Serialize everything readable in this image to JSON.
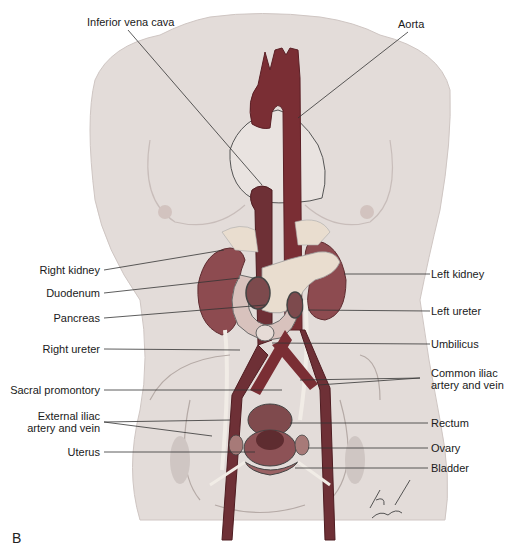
{
  "figure": {
    "panel_letter": "B",
    "signature": "Pat Thomas",
    "colors": {
      "skin": "#e3dcd9",
      "skin_shadow": "#cfc6c3",
      "vessel": "#7a2e34",
      "vessel_dark": "#5a1f25",
      "kidney": "#8d4b50",
      "pancreas": "#e9ddcf",
      "duodenum": "#d8c2bd",
      "ureter": "#f1ece6",
      "leader_line": "#333333"
    }
  },
  "labels": {
    "top": [
      {
        "id": "inferior-vena-cava",
        "text": "Inferior vena cava"
      },
      {
        "id": "aorta",
        "text": "Aorta"
      }
    ],
    "left": [
      {
        "id": "right-kidney",
        "text": "Right kidney"
      },
      {
        "id": "duodenum",
        "text": "Duodenum"
      },
      {
        "id": "pancreas",
        "text": "Pancreas"
      },
      {
        "id": "right-ureter",
        "text": "Right ureter"
      },
      {
        "id": "sacral-promontory",
        "text": "Sacral promontory"
      },
      {
        "id": "external-iliac",
        "line1": "External iliac",
        "line2": "artery and vein"
      },
      {
        "id": "uterus",
        "text": "Uterus"
      }
    ],
    "right": [
      {
        "id": "left-kidney",
        "text": "Left kidney"
      },
      {
        "id": "left-ureter",
        "text": "Left ureter"
      },
      {
        "id": "umbilicus",
        "text": "Umbilicus"
      },
      {
        "id": "common-iliac",
        "line1": "Common iliac",
        "line2": "artery and vein"
      },
      {
        "id": "rectum",
        "text": "Rectum"
      },
      {
        "id": "ovary",
        "text": "Ovary"
      },
      {
        "id": "bladder",
        "text": "Bladder"
      }
    ]
  }
}
